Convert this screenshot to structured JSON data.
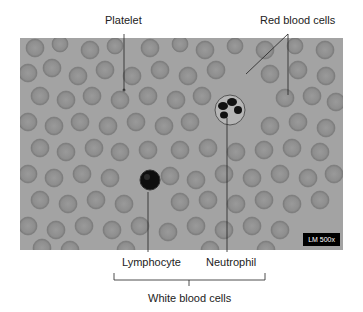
{
  "labels": {
    "platelet": "Platelet",
    "red_blood_cells": "Red blood cells",
    "lymphocyte": "Lymphocyte",
    "neutrophil": "Neutrophil",
    "white_blood_cells": "White blood cells"
  },
  "micrograph": {
    "scale_label": "LM 500x",
    "background_color": "#a3a3a3",
    "cell_color": "#8f8f8f"
  }
}
